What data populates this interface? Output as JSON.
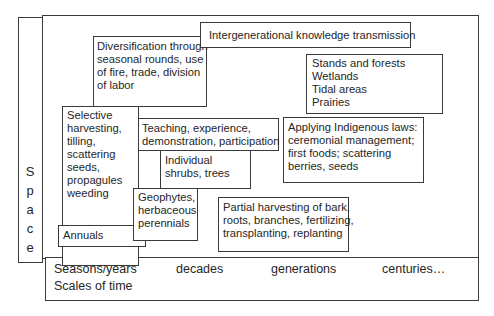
{
  "axes": {
    "y_axis": {
      "label": "Space",
      "letters": [
        "S",
        "p",
        "a",
        "c",
        "e"
      ]
    },
    "x_axis": {
      "ticks": [
        "Seasons/years",
        "decades",
        "generations",
        "centuries…"
      ],
      "label": "Scales of time"
    }
  },
  "boxes": {
    "intergenerational": {
      "text": "Intergenerational knowledge transmission"
    },
    "diversification": {
      "text": "Diversification through\nseasonal rounds, use\nof fire, trade, division\nof labor"
    },
    "stands": {
      "text": "Stands and forests\nWetlands\nTidal areas\nPrairies"
    },
    "selective": {
      "text": "Selective\nharvesting,\ntilling,\nscattering\nseeds,\npropagules\nweeding"
    },
    "teaching": {
      "text": "Teaching, experience,\ndemonstration, participation"
    },
    "applying": {
      "text": "Applying Indigenous laws:\nceremonial management;\nfirst foods; scattering\nberries, seeds"
    },
    "individual": {
      "text": "Individual\nshrubs, trees"
    },
    "geophytes": {
      "text": "Geophytes,\nherbaceous\nperennials"
    },
    "annuals": {
      "text": "Annuals"
    },
    "partial": {
      "text": "Partial harvesting of bark,\nroots, branches, fertilizing,\ntransplanting, replanting"
    }
  }
}
